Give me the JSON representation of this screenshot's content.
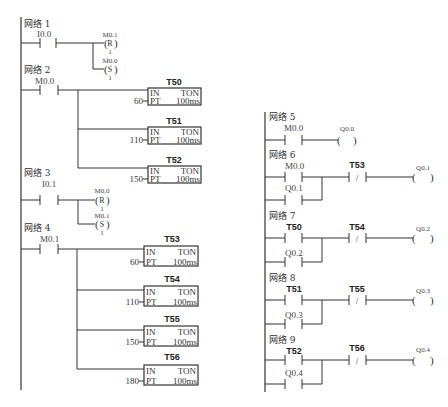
{
  "left_column": {
    "networks": [
      {
        "label": "网络 1",
        "contact": "I0.0",
        "coils": [
          {
            "address": "M0.1",
            "type": "R",
            "count": "1"
          },
          {
            "address": "M0.0",
            "type": "S",
            "count": "1"
          }
        ]
      },
      {
        "label": "网络 2",
        "contact": "M0.0",
        "timers": [
          {
            "name": "T50",
            "in": "IN",
            "type": "TON",
            "pt_label": "PT",
            "preset": "60",
            "base": "100ms"
          },
          {
            "name": "T51",
            "in": "IN",
            "type": "TON",
            "pt_label": "PT",
            "preset": "110",
            "base": "100ms"
          },
          {
            "name": "T52",
            "in": "IN",
            "type": "TON",
            "pt_label": "PT",
            "preset": "150",
            "base": "100ms"
          }
        ]
      },
      {
        "label": "网络 3",
        "contact": "I0.1",
        "coils": [
          {
            "address": "M0.0",
            "type": "R",
            "count": "1"
          },
          {
            "address": "M0.1",
            "type": "S",
            "count": "1"
          }
        ]
      },
      {
        "label": "网络 4",
        "contact": "M0.1",
        "timers": [
          {
            "name": "T53",
            "in": "IN",
            "type": "TON",
            "pt_label": "PT",
            "preset": "60",
            "base": "100ms"
          },
          {
            "name": "T54",
            "in": "IN",
            "type": "TON",
            "pt_label": "PT",
            "preset": "110",
            "base": "100ms"
          },
          {
            "name": "T55",
            "in": "IN",
            "type": "TON",
            "pt_label": "PT",
            "preset": "150",
            "base": "100ms"
          },
          {
            "name": "T56",
            "in": "IN",
            "type": "TON",
            "pt_label": "PT",
            "preset": "180",
            "base": "100ms"
          }
        ]
      }
    ]
  },
  "right_column": {
    "networks": [
      {
        "label": "网络 5",
        "contact": "M0.0",
        "coil": "Q0.0"
      },
      {
        "label": "网络 6",
        "contact": "M0.0",
        "parallel": "Q0.1",
        "nc_contact": "T53",
        "coil": "Q0.1"
      },
      {
        "label": "网络 7",
        "contact": "T50",
        "parallel": "Q0.2",
        "nc_contact": "T54",
        "coil": "Q0.2"
      },
      {
        "label": "网络 8",
        "contact": "T51",
        "parallel": "Q0.3",
        "nc_contact": "T55",
        "coil": "Q0.3"
      },
      {
        "label": "网络 9",
        "contact": "T52",
        "parallel": "Q0.4",
        "nc_contact": "T56",
        "coil": "Q0.4"
      }
    ]
  },
  "symbols": {
    "nc_slash": "/",
    "paren_open": "(",
    "paren_close": ")"
  }
}
